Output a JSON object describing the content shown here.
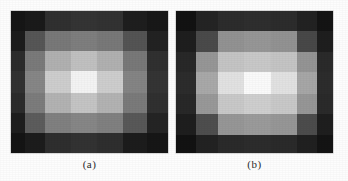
{
  "figure": {
    "background_color": "#fdfdfd",
    "panels": [
      {
        "id": "panel-a",
        "caption": "(a)",
        "name": "grayscale-matrix-a"
      },
      {
        "id": "panel-b",
        "caption": "(b)",
        "name": "grayscale-matrix-b"
      }
    ]
  },
  "chart_data": [
    {
      "type": "heatmap",
      "title": "(a)",
      "xlabel": "",
      "ylabel": "",
      "colormap": "grayscale",
      "vmin": 0,
      "vmax": 255,
      "grid": true,
      "legend": "none",
      "rows": 7,
      "cols": 7,
      "col_widths": [
        14,
        20,
        26,
        26,
        26,
        24,
        21
      ],
      "row_heights": [
        20,
        20,
        20,
        22,
        20,
        20,
        20
      ],
      "values": [
        [
          22,
          26,
          48,
          52,
          50,
          30,
          24
        ],
        [
          28,
          86,
          120,
          126,
          120,
          84,
          34
        ],
        [
          44,
          122,
          176,
          192,
          176,
          120,
          48
        ],
        [
          50,
          134,
          205,
          243,
          205,
          132,
          52
        ],
        [
          44,
          124,
          178,
          196,
          178,
          122,
          48
        ],
        [
          30,
          92,
          128,
          134,
          128,
          88,
          36
        ],
        [
          20,
          28,
          46,
          50,
          46,
          28,
          22
        ]
      ]
    },
    {
      "type": "heatmap",
      "title": "(b)",
      "xlabel": "",
      "ylabel": "",
      "colormap": "grayscale",
      "vmin": 0,
      "vmax": 255,
      "grid": true,
      "legend": "none",
      "rows": 7,
      "cols": 7,
      "col_widths": [
        20,
        22,
        26,
        28,
        26,
        20,
        16
      ],
      "row_heights": [
        20,
        22,
        20,
        22,
        20,
        22,
        18
      ],
      "values": [
        [
          18,
          36,
          44,
          46,
          44,
          34,
          20
        ],
        [
          30,
          74,
          146,
          150,
          146,
          72,
          30
        ],
        [
          40,
          150,
          196,
          200,
          196,
          148,
          42
        ],
        [
          44,
          168,
          225,
          250,
          225,
          166,
          44
        ],
        [
          40,
          152,
          200,
          206,
          200,
          150,
          42
        ],
        [
          30,
          78,
          150,
          154,
          150,
          76,
          30
        ],
        [
          18,
          34,
          42,
          44,
          42,
          32,
          20
        ]
      ]
    }
  ]
}
